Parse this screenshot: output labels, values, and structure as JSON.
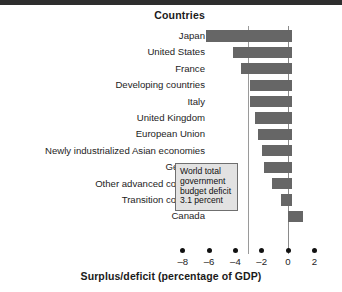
{
  "header": {
    "countries_label": "Countries"
  },
  "callout": {
    "line1": "World total",
    "line2": "government",
    "line3": "budget deficit",
    "line4": "3.1 percent"
  },
  "axis": {
    "title": "Surplus/deficit (percentage of GDP)",
    "tick_labels": [
      "–8",
      "–6",
      "–4",
      "–2",
      "0",
      "2"
    ]
  },
  "colors": {
    "bar": "#666666",
    "zero_line": "#8a8a8a",
    "reference_line": "#9a9a9a",
    "callout_bg": "#e2e2e2",
    "callout_border": "#6f6f6f",
    "background": "#ffffff"
  },
  "chart_data": {
    "type": "bar",
    "orientation": "horizontal",
    "title": "Countries",
    "xlabel": "Surplus/deficit (percentage of GDP)",
    "ylabel": "Countries",
    "xlim": [
      -9,
      3
    ],
    "xticks": [
      -8,
      -6,
      -4,
      -2,
      0,
      2
    ],
    "grid": false,
    "legend": "none",
    "annotations": [
      {
        "text": "World total government budget deficit 3.1 percent",
        "value": -3.1,
        "type": "reference-line-callout"
      }
    ],
    "categories": [
      "Japan",
      "United States",
      "France",
      "Developing countries",
      "Italy",
      "United Kingdom",
      "European Union",
      "Newly industrialized Asian economies",
      "Germany",
      "Other advanced countries",
      "Transition countries",
      "Canada"
    ],
    "values": [
      -6.2,
      -4.2,
      -3.6,
      -2.9,
      -2.9,
      -2.5,
      -2.3,
      -2.0,
      -1.8,
      -1.2,
      -0.5,
      0.8
    ]
  }
}
